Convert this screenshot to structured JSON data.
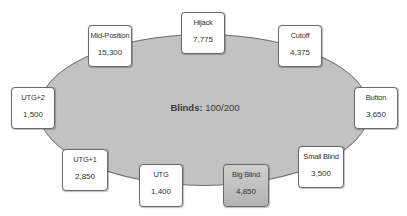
{
  "table": {
    "blinds_label": "Blinds:",
    "blinds_value": "100/200"
  },
  "seats": [
    {
      "name": "Hijack",
      "stack": "7,775"
    },
    {
      "name": "Cutoff",
      "stack": "4,375"
    },
    {
      "name": "Button",
      "stack": "3,650"
    },
    {
      "name": "Small Blind",
      "stack": "3,500"
    },
    {
      "name": "Big Blind",
      "stack": "4,850",
      "highlighted": true
    },
    {
      "name": "UTG",
      "stack": "1,400"
    },
    {
      "name": "UTG+1",
      "stack": "2,850"
    },
    {
      "name": "UTG+2",
      "stack": "1,500"
    },
    {
      "name": "Mid-Position",
      "stack": "15,300"
    }
  ],
  "colors": {
    "table_fill": "#c2c2c2",
    "table_border": "#6f6f6f",
    "seat_fill": "#ffffff",
    "highlight_fill": "#bdbdbd"
  }
}
